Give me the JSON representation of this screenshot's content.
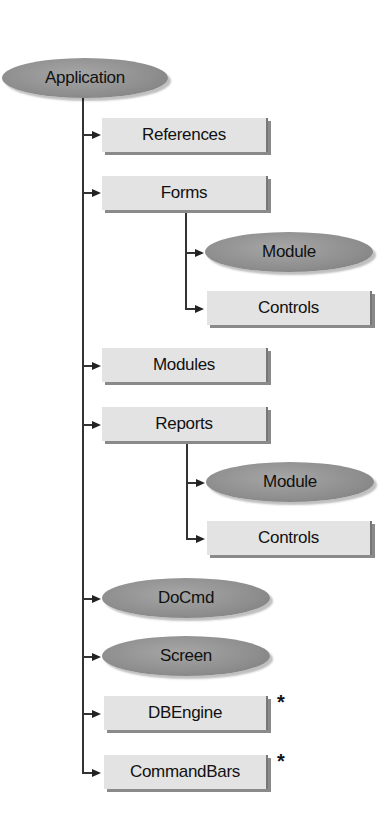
{
  "diagram": {
    "type": "object-hierarchy",
    "root": {
      "label": "Application",
      "shape": "ellipse"
    },
    "nodes": [
      {
        "label": "References",
        "shape": "rect",
        "parent": "Application"
      },
      {
        "label": "Forms",
        "shape": "rect",
        "parent": "Application",
        "children": [
          {
            "label": "Module",
            "shape": "ellipse"
          },
          {
            "label": "Controls",
            "shape": "rect"
          }
        ]
      },
      {
        "label": "Modules",
        "shape": "rect",
        "parent": "Application"
      },
      {
        "label": "Reports",
        "shape": "rect",
        "parent": "Application",
        "children": [
          {
            "label": "Module",
            "shape": "ellipse"
          },
          {
            "label": "Controls",
            "shape": "rect"
          }
        ]
      },
      {
        "label": "DoCmd",
        "shape": "ellipse",
        "parent": "Application"
      },
      {
        "label": "Screen",
        "shape": "ellipse",
        "parent": "Application"
      },
      {
        "label": "DBEngine",
        "shape": "rect",
        "parent": "Application",
        "marker": "*"
      },
      {
        "label": "CommandBars",
        "shape": "rect",
        "parent": "Application",
        "marker": "*"
      }
    ],
    "legend": {
      "ellipse": "object",
      "rect": "object and collection"
    }
  }
}
